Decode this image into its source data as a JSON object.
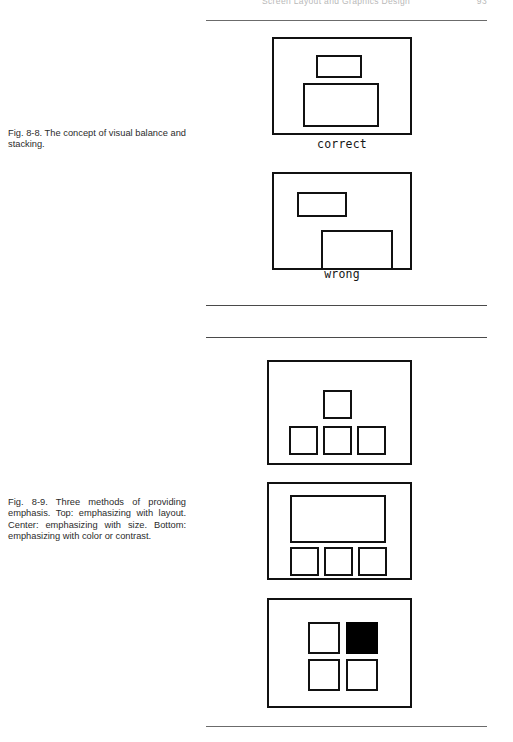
{
  "page": {
    "running_head": {
      "title": "Screen Layout and Graphics Design",
      "page_number": "93"
    },
    "background_color": "#ffffff",
    "ink_color": "#111111"
  },
  "rules": [
    {
      "name": "rule-above-fig-8-8",
      "y": 20
    },
    {
      "name": "rule-below-fig-8-8",
      "y": 305
    },
    {
      "name": "rule-above-fig-8-9",
      "y": 337
    },
    {
      "name": "rule-below-fig-8-9",
      "y": 726
    }
  ],
  "figures": [
    {
      "id": "fig-8-8",
      "caption": "Fig. 8-8. The concept of visual balance and stacking.",
      "caption_top": 128,
      "panels": [
        {
          "id": "fig-8-8-correct",
          "label": "correct",
          "label_top": 137,
          "frame": {
            "left": 272,
            "top": 37,
            "width": 140,
            "height": 98
          },
          "blocks": [
            {
              "name": "small-block",
              "left": 316,
              "top": 55,
              "width": 46,
              "height": 23,
              "fill": "white"
            },
            {
              "name": "large-block",
              "left": 303,
              "top": 83,
              "width": 76,
              "height": 44,
              "fill": "white"
            }
          ]
        },
        {
          "id": "fig-8-8-wrong",
          "label": "wrong",
          "label_top": 267,
          "frame": {
            "left": 272,
            "top": 172,
            "width": 140,
            "height": 98
          },
          "blocks": [
            {
              "name": "small-block",
              "left": 295,
              "top": 190,
              "width": 50,
              "height": 25,
              "fill": "white"
            },
            {
              "name": "large-block",
              "left": 319,
              "top": 228,
              "width": 72,
              "height": 40,
              "fill": "white"
            }
          ]
        }
      ]
    },
    {
      "id": "fig-8-9",
      "caption": "Fig. 8-9. Three methods of providing emphasis. Top: emphasizing with layout. Center: emphasizing with size. Bottom: emphasizing with color or contrast.",
      "caption_top": 497,
      "panels": [
        {
          "id": "fig-8-9-layout",
          "label": "",
          "frame": {
            "left": 267,
            "top": 360,
            "width": 145,
            "height": 105
          },
          "blocks": [
            {
              "name": "emphasis-square-top",
              "left": 321,
              "top": 388,
              "width": 29,
              "height": 29,
              "fill": "white"
            },
            {
              "name": "square-row-left",
              "left": 287,
              "top": 424,
              "width": 29,
              "height": 29,
              "fill": "white"
            },
            {
              "name": "square-row-center",
              "left": 321,
              "top": 424,
              "width": 29,
              "height": 29,
              "fill": "white"
            },
            {
              "name": "square-row-right",
              "left": 355,
              "top": 424,
              "width": 29,
              "height": 29,
              "fill": "white"
            }
          ]
        },
        {
          "id": "fig-8-9-size",
          "label": "",
          "frame": {
            "left": 267,
            "top": 482,
            "width": 145,
            "height": 98
          },
          "blocks": [
            {
              "name": "emphasis-wide-block",
              "left": 288,
              "top": 493,
              "width": 96,
              "height": 48,
              "fill": "white"
            },
            {
              "name": "square-row-left",
              "left": 288,
              "top": 545,
              "width": 29,
              "height": 29,
              "fill": "white"
            },
            {
              "name": "square-row-center",
              "left": 322,
              "top": 545,
              "width": 29,
              "height": 29,
              "fill": "white"
            },
            {
              "name": "square-row-right",
              "left": 356,
              "top": 545,
              "width": 29,
              "height": 29,
              "fill": "white"
            }
          ]
        },
        {
          "id": "fig-8-9-contrast",
          "label": "",
          "frame": {
            "left": 267,
            "top": 598,
            "width": 145,
            "height": 110
          },
          "blocks": [
            {
              "name": "square-top-left",
              "left": 306,
              "top": 620,
              "width": 32,
              "height": 32,
              "fill": "white"
            },
            {
              "name": "square-top-right-emphasis",
              "left": 344,
              "top": 620,
              "width": 32,
              "height": 32,
              "fill": "black"
            },
            {
              "name": "square-bottom-left",
              "left": 306,
              "top": 657,
              "width": 32,
              "height": 32,
              "fill": "white"
            },
            {
              "name": "square-bottom-right",
              "left": 344,
              "top": 657,
              "width": 32,
              "height": 32,
              "fill": "white"
            }
          ]
        }
      ]
    }
  ]
}
